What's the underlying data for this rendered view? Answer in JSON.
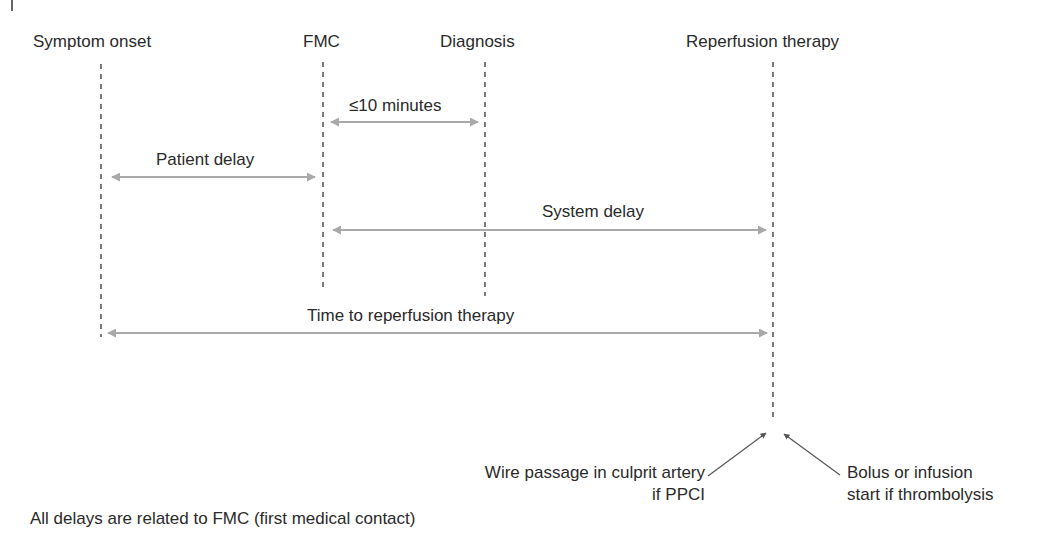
{
  "diagram": {
    "milestones": [
      {
        "id": "symptom-onset",
        "label": "Symptom onset",
        "x": 101
      },
      {
        "id": "fmc",
        "label": "FMC",
        "x": 323
      },
      {
        "id": "diagnosis",
        "label": "Diagnosis",
        "x": 485
      },
      {
        "id": "reperfusion-therapy",
        "label": "Reperfusion therapy",
        "x": 773
      }
    ],
    "intervals": [
      {
        "id": "fmc-to-diagnosis",
        "label": "≤10 minutes",
        "from": "FMC",
        "to": "Diagnosis"
      },
      {
        "id": "patient-delay",
        "label": "Patient delay",
        "from": "Symptom onset",
        "to": "FMC"
      },
      {
        "id": "system-delay",
        "label": "System delay",
        "from": "FMC",
        "to": "Reperfusion therapy"
      },
      {
        "id": "time-to-reperfusion",
        "label": "Time to reperfusion therapy",
        "from": "Symptom onset",
        "to": "Reperfusion therapy"
      }
    ],
    "annotations": {
      "ppci_line1": "Wire passage in culprit artery",
      "ppci_line2": "if PPCI",
      "thrombolysis_line1": "Bolus or infusion",
      "thrombolysis_line2": "start if thrombolysis"
    },
    "footnote": "All delays are related to FMC (first medical contact)",
    "colors": {
      "text": "#2a2a2a",
      "arrow": "#a9a9a9",
      "dashed_line": "#333333",
      "pointer": "#555555"
    }
  }
}
